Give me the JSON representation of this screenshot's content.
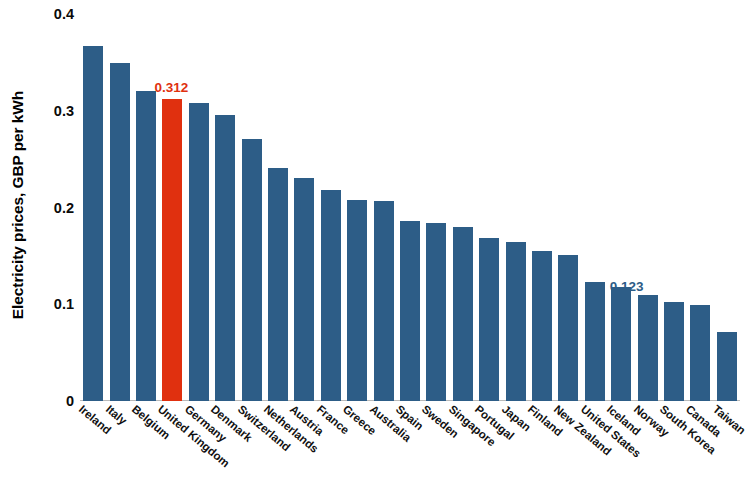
{
  "chart_data": {
    "type": "bar",
    "title": "",
    "subtitle": "",
    "xlabel": "",
    "ylabel": "Electricity prices, GBP per kWh",
    "ylim": [
      0,
      0.4
    ],
    "yticks": [
      "0",
      "0.1",
      "0.2",
      "0.3",
      "0.4"
    ],
    "ytick_values": [
      0,
      0.1,
      0.2,
      0.3,
      0.4
    ],
    "grid": false,
    "legend": null,
    "units": "GBP per kWh",
    "categories": [
      "Ireland",
      "Italy",
      "Belgium",
      "United Kingdom",
      "Germany",
      "Denmark",
      "Switzerland",
      "Netherlands",
      "Austria",
      "France",
      "Greece",
      "Australia",
      "Spain",
      "Sweden",
      "Singapore",
      "Portugal",
      "Japan",
      "Finland",
      "New Zealand",
      "United States",
      "Iceland",
      "Norway",
      "South Korea",
      "Canada",
      "Taiwan"
    ],
    "values": [
      0.367,
      0.349,
      0.32,
      0.312,
      0.308,
      0.296,
      0.271,
      0.241,
      0.23,
      0.218,
      0.208,
      0.207,
      0.186,
      0.184,
      0.18,
      0.168,
      0.164,
      0.155,
      0.151,
      0.123,
      0.118,
      0.11,
      0.102,
      0.099,
      0.071
    ],
    "annotations": [
      {
        "category": "United Kingdom",
        "index": 3,
        "text": "0.312",
        "color": "#e0300f",
        "position": "above"
      },
      {
        "category": "United States",
        "index": 19,
        "text": "0.123",
        "color": "#2d5d87",
        "position": "right"
      }
    ],
    "colors": {
      "bar": "#2d5d87",
      "highlight_bar": "#e0300f",
      "highlight_label": "#e0300f",
      "annotation_label": "#2d5d87",
      "axis_text": "#0a0a0a",
      "baseline": "#b9b9b9",
      "background": "#ffffff"
    },
    "highlight_index": 3
  }
}
